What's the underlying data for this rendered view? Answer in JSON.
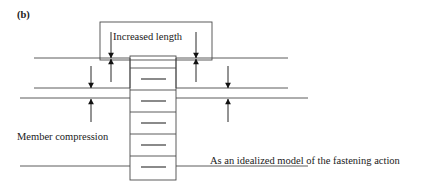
{
  "figure": {
    "panel_label": "(b)",
    "increased_length_label": "Increased length",
    "member_compression_label": "Member compression",
    "idealized_model_line1": "As an idealized model of the fastening action",
    "idealized_model_line2": "can be seen here",
    "colors": {
      "line": "#4a4a4a",
      "thread": "#7d7d7d",
      "arrow": "#111111",
      "text": "#1a1a1a",
      "background": "#ffffff"
    },
    "geometry": {
      "top_member_line_y": 58,
      "bracket_bottom_line_y": 88,
      "middle_member_line_y": 98,
      "bottom_member_line_y": 166,
      "bolt_left_x": 130,
      "bolt_right_x": 176,
      "bolt_top_y": 56,
      "bolt_bottom_y": 180,
      "callout_box": {
        "x": 100,
        "y": 22,
        "width": 112,
        "height": 38
      },
      "thread_segment_divider_y": [
        68,
        90,
        112,
        134,
        156
      ],
      "thread_dash_y": [
        79,
        101,
        123,
        145,
        167
      ]
    }
  }
}
